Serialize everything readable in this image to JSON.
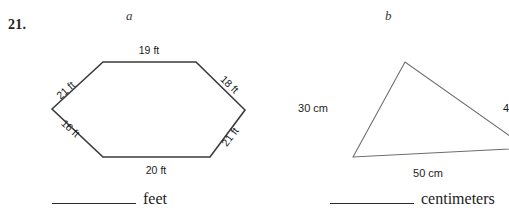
{
  "problem": {
    "number": "21."
  },
  "parts": [
    {
      "letter": "a",
      "shape": "hexagon",
      "unit_word": "feet",
      "unit_abbrev": "ft",
      "answer_value": "",
      "side_labels": [
        "19 ft",
        "18 ft",
        "21 ft",
        "20 ft",
        "16 ft",
        "21 ft"
      ],
      "sides": [
        {
          "name": "top",
          "label": "19 ft",
          "value": 19,
          "unit": "ft"
        },
        {
          "name": "upper-right",
          "label": "18 ft",
          "value": 18,
          "unit": "ft"
        },
        {
          "name": "lower-right",
          "label": "21 ft",
          "value": 21,
          "unit": "ft"
        },
        {
          "name": "bottom",
          "label": "20 ft",
          "value": 20,
          "unit": "ft"
        },
        {
          "name": "lower-left",
          "label": "16 ft",
          "value": 16,
          "unit": "ft"
        },
        {
          "name": "upper-left",
          "label": "21 ft",
          "value": 21,
          "unit": "ft"
        }
      ]
    },
    {
      "letter": "b",
      "shape": "triangle",
      "unit_word": "centimeters",
      "unit_abbrev": "cm",
      "answer_value": "",
      "side_labels": [
        "30 cm",
        "40",
        "50 cm"
      ],
      "sides": [
        {
          "name": "left",
          "label": "30 cm",
          "value": 30,
          "unit": "cm"
        },
        {
          "name": "right",
          "label": "40",
          "value": 40,
          "unit": "cm",
          "clipped": true
        },
        {
          "name": "bottom",
          "label": "50 cm",
          "value": 50,
          "unit": "cm"
        }
      ]
    }
  ],
  "colors": {
    "ink": "#231f20",
    "figure_stroke": "#3b3b3b",
    "figure_stroke_light": "#6a6a6a",
    "paper": "#ffffff"
  }
}
